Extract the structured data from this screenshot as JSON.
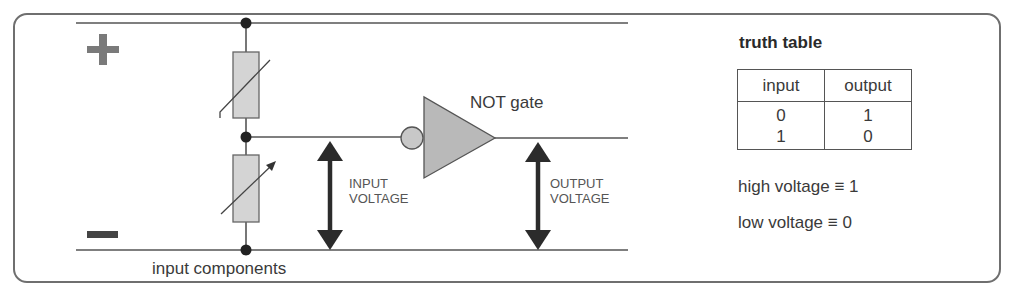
{
  "diagram": {
    "polarity": {
      "positive": "+",
      "negative": "−"
    },
    "gate_label": "NOT gate",
    "input_voltage_label": [
      "INPUT",
      "VOLTAGE"
    ],
    "output_voltage_label": [
      "OUTPUT",
      "VOLTAGE"
    ],
    "components_label": "input components",
    "components": [
      "thermistor",
      "variable-resistor"
    ],
    "colors": {
      "wire": "#555555",
      "node": "#222222",
      "component_fill": "#d4d4d4",
      "gate_fill": "#b9b9b9",
      "arrow": "#2b2b2b",
      "plus": "#7a7a7a",
      "minus": "#444444",
      "frame": "#6f6f6f"
    }
  },
  "truth_table": {
    "title": "truth table",
    "headers": [
      "input",
      "output"
    ],
    "rows": [
      [
        "0",
        "1"
      ],
      [
        "1",
        "0"
      ]
    ]
  },
  "notes": [
    "high voltage ≡ 1",
    "low voltage ≡ 0"
  ]
}
